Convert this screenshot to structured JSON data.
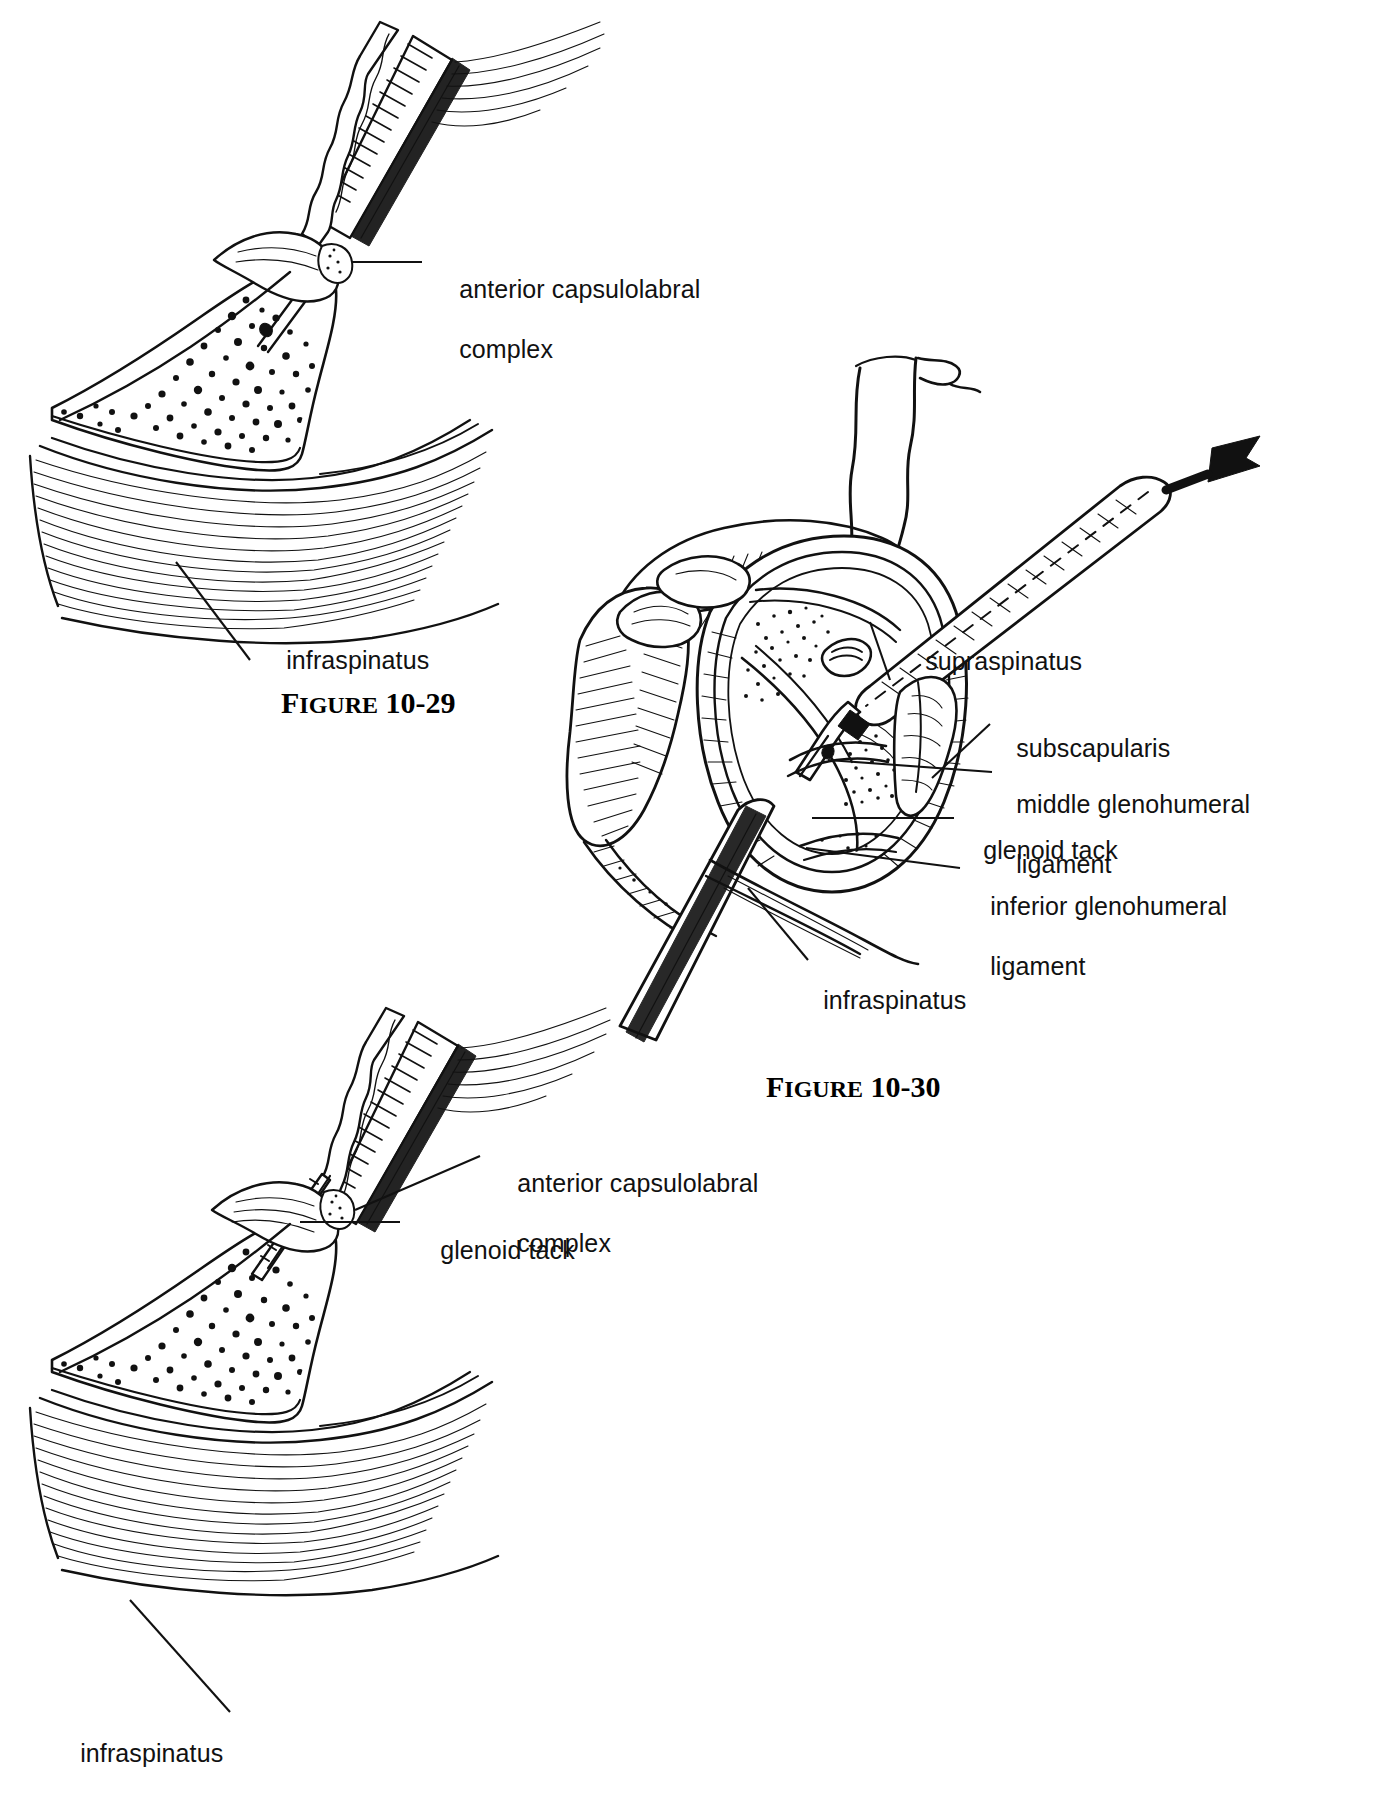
{
  "page": {
    "type": "anatomical-illustration-plate",
    "background": "#ffffff",
    "ink_color": "#111111"
  },
  "figures": [
    {
      "id": "figure-10-29",
      "caption_word": "FIGURE",
      "caption_number": "10-29",
      "position": "top-left",
      "description": "Sagittal cutaway of glenoid rim with cannulated instrument driving a tack through the anterior capsulolabral complex, infraspinatus muscle below",
      "labels": [
        {
          "name": "anterior-capsulolabral-complex",
          "lines": [
            "anterior capsulolabral",
            "complex"
          ]
        },
        {
          "name": "infraspinatus",
          "lines": [
            "infraspinatus"
          ]
        }
      ]
    },
    {
      "id": "figure-10-30",
      "caption_word": "FIGURE",
      "caption_number": "10-30",
      "position": "right-middle",
      "description": "Arthroscopic view of the glenoid fossa from posterior portal, showing arthroscope, cannula with glenoid tack, and surrounding rotator cuff and glenohumeral ligaments",
      "has_arrow": true,
      "labels": [
        {
          "name": "supraspinatus",
          "lines": [
            "supraspinatus"
          ]
        },
        {
          "name": "subscapularis",
          "lines": [
            "subscapularis"
          ]
        },
        {
          "name": "middle-glenohumeral-ligament",
          "lines": [
            "middle glenohumeral",
            "ligament"
          ]
        },
        {
          "name": "glenoid-tack",
          "lines": [
            "glenoid tack"
          ]
        },
        {
          "name": "inferior-glenohumeral-ligament",
          "lines": [
            "inferior glenohumeral",
            "ligament"
          ]
        },
        {
          "name": "infraspinatus",
          "lines": [
            "infraspinatus"
          ]
        }
      ]
    },
    {
      "id": "figure-10-31",
      "caption_word": "",
      "caption_number": "",
      "position": "bottom-left",
      "description": "Sagittal cutaway of glenoid rim with tack seated in bone beneath the anterior capsulolabral complex, instrument withdrawing",
      "labels": [
        {
          "name": "anterior-capsulolabral-complex",
          "lines": [
            "anterior capsulolabral",
            "complex"
          ]
        },
        {
          "name": "glenoid-tack",
          "lines": [
            "glenoid tack"
          ]
        },
        {
          "name": "infraspinatus",
          "lines": [
            "infraspinatus"
          ]
        }
      ]
    }
  ],
  "text": {
    "anterior_capsulolabral_1": "anterior capsulolabral",
    "anterior_capsulolabral_2": "complex",
    "infraspinatus": "infraspinatus",
    "supraspinatus": "supraspinatus",
    "subscapularis": "subscapularis",
    "middle_ghl_1": "middle glenohumeral",
    "middle_ghl_2": "ligament",
    "glenoid_tack": "glenoid tack",
    "inferior_ghl_1": "inferior glenohumeral",
    "inferior_ghl_2": "ligament",
    "figure_word": "FIGURE",
    "figure_word_caps": "IGURE",
    "figure_initial": "F",
    "fig_29_number": "10-29",
    "fig_30_number": "10-30"
  }
}
